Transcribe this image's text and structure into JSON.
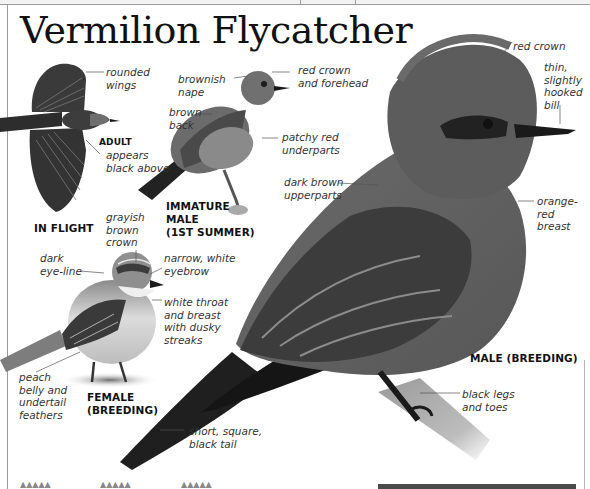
{
  "page": {
    "title": "Vermilion Flycatcher",
    "accent_colors": {
      "ink": "#111111",
      "label": "#333333",
      "rule": "#9a9a9a"
    }
  },
  "figures": {
    "in_flight": {
      "caption": "IN FLIGHT",
      "labels": {
        "rounded_wings": "rounded\nwings",
        "adult_tag": "ADULT",
        "appears_black": "appears\nblack above"
      }
    },
    "immature_male": {
      "caption": "IMMATURE\nMALE\n(1ST SUMMER)",
      "labels": {
        "brownish_nape": "brownish\nnape",
        "red_crown_forehead": "red crown\nand forehead",
        "brown_back": "brown\nback",
        "patchy_red": "patchy red\nunderparts"
      }
    },
    "female": {
      "caption": "FEMALE\n(BREEDING)",
      "labels": {
        "grayish_crown": "grayish\nbrown\ncrown",
        "dark_eyeline": "dark\neye-line",
        "white_eyebrow": "narrow, white\neyebrow",
        "white_throat": "white throat\nand breast\nwith dusky\nstreaks",
        "peach_belly": "peach\nbelly and\nundertail\nfeathers"
      }
    },
    "male": {
      "caption": "MALE (BREEDING)",
      "labels": {
        "red_crown": "red crown",
        "bill": "thin,\nslightly\nhooked\nbill",
        "dark_upperparts": "dark brown\nupperparts",
        "orange_breast": "orange-\nred\nbreast",
        "black_legs": "black legs\nand toes",
        "tail": "short, square,\nblack tail"
      }
    }
  },
  "footer": {
    "marks": [
      "▲▲▲▲▲",
      "▲▲▲▲▲",
      "▲▲▲▲▲"
    ]
  }
}
